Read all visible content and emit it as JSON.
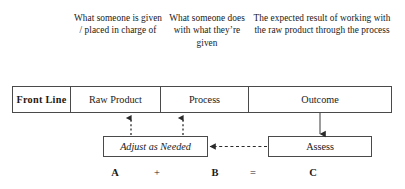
{
  "diagram": {
    "captions": [
      {
        "id": "raw-product",
        "text": "What someone is given / placed in charge of"
      },
      {
        "id": "process",
        "text": "What someone does with what they’re given"
      },
      {
        "id": "outcome",
        "text": "The expected result of working with the raw product through the process"
      }
    ],
    "front_line_row": {
      "label": "Front Line",
      "cells": [
        {
          "id": "raw-product",
          "label": "Raw Product"
        },
        {
          "id": "process",
          "label": "Process"
        },
        {
          "id": "outcome",
          "label": "Outcome"
        }
      ]
    },
    "lower_boxes": [
      {
        "id": "adjust",
        "label": "Adjust as Needed",
        "style": "italic"
      },
      {
        "id": "assess",
        "label": "Assess",
        "style": "normal"
      }
    ],
    "equation": {
      "a": "A",
      "plus": "+",
      "b": "B",
      "equals": "=",
      "c": "C"
    },
    "colors": {
      "border": "#4a4a4a",
      "text": "#1a1a1a",
      "background": "#ffffff",
      "connector": "#3a3a3a"
    }
  }
}
